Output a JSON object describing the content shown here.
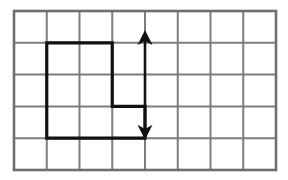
{
  "figure": {
    "background_color": "#ffffff"
  },
  "grid": {
    "columns": 8,
    "rows": 5,
    "origin_x": 14,
    "origin_y": 11,
    "cell_width": 32.75,
    "cell_height": 31.8,
    "line_color": "#7d7d7d",
    "line_width": 2,
    "border_color": "#6e6e6e",
    "border_width": 2.6
  },
  "shape": {
    "name": "l-shaped-polygon",
    "stroke_color": "#111111",
    "stroke_width": 3.2,
    "fill": "none",
    "vertices_grid": [
      [
        1,
        1
      ],
      [
        3,
        1
      ],
      [
        3,
        3
      ],
      [
        4,
        3
      ],
      [
        4,
        4
      ],
      [
        1,
        4
      ]
    ],
    "closed": true,
    "area_cells": 8
  },
  "arrow": {
    "name": "vertical-double-arrow",
    "color": "#111111",
    "shaft_width": 2.6,
    "x_grid": 4,
    "y_top_grid": 0.6,
    "y_bottom_grid": 4.05,
    "head_half_width": 7.5,
    "head_length": 15,
    "double_headed": true
  },
  "chart_data": {
    "type": "diagram",
    "grid_columns": 8,
    "grid_rows": 5,
    "polygon_vertices": [
      [
        1,
        1
      ],
      [
        3,
        1
      ],
      [
        3,
        3
      ],
      [
        4,
        3
      ],
      [
        4,
        4
      ],
      [
        1,
        4
      ]
    ],
    "polygon_area_cells": 8,
    "arrow_column_line": 4,
    "arrow_span_rows": 3.45,
    "labels": []
  }
}
